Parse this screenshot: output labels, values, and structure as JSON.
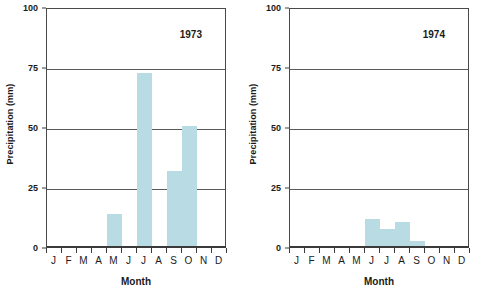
{
  "chart_data": [
    {
      "type": "bar",
      "title": "1973",
      "xlabel": "Month",
      "ylabel": "Precipitation (mm)",
      "categories": [
        "J",
        "F",
        "M",
        "A",
        "M",
        "J",
        "J",
        "A",
        "S",
        "O",
        "N",
        "D"
      ],
      "values": [
        0,
        0,
        0,
        0,
        14,
        0,
        73,
        0,
        32,
        51,
        0,
        0
      ],
      "ylim": [
        0,
        100
      ],
      "yticks": [
        0,
        25,
        50,
        75,
        100
      ],
      "grid": true,
      "legend": "none",
      "bar_color": "#b8dbe4"
    },
    {
      "type": "bar",
      "title": "1974",
      "xlabel": "Month",
      "ylabel": "Precipitation (mm)",
      "categories": [
        "J",
        "F",
        "M",
        "A",
        "M",
        "J",
        "J",
        "A",
        "S",
        "O",
        "N",
        "D"
      ],
      "values": [
        0,
        0,
        0,
        0,
        0,
        12,
        8,
        11,
        3,
        0,
        0,
        0
      ],
      "ylim": [
        0,
        100
      ],
      "yticks": [
        0,
        25,
        50,
        75,
        100
      ],
      "grid": true,
      "legend": "none",
      "bar_color": "#b8dbe4"
    }
  ],
  "panels": [
    {
      "year_label": "1973",
      "ylabel": "Precipitation (mm)",
      "xlabel": "Month",
      "ytick_labels": [
        "0",
        "25",
        "50",
        "75",
        "100"
      ],
      "month_labels": [
        "J",
        "F",
        "M",
        "A",
        "M",
        "J",
        "J",
        "A",
        "S",
        "O",
        "N",
        "D"
      ]
    },
    {
      "year_label": "1974",
      "ylabel": "Precipitation (mm)",
      "xlabel": "Month",
      "ytick_labels": [
        "0",
        "25",
        "50",
        "75",
        "100"
      ],
      "month_labels": [
        "J",
        "F",
        "M",
        "A",
        "M",
        "J",
        "J",
        "A",
        "S",
        "O",
        "N",
        "D"
      ]
    }
  ],
  "colors": {
    "bar_fill": "#b8dbe4",
    "axis": "#3a3a3a",
    "gridline": "#5a5a5a",
    "background": "#ffffff",
    "text": "#1a1a1a"
  }
}
